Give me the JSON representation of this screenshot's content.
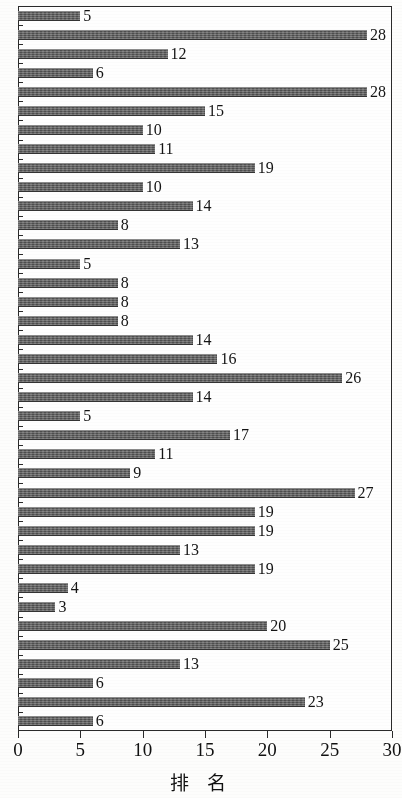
{
  "chart_data": {
    "type": "bar",
    "orientation": "horizontal",
    "title": "",
    "xlabel": "排  名",
    "ylabel": "",
    "xlim": [
      0,
      30
    ],
    "ylim": [
      0,
      38
    ],
    "grid": false,
    "legend": null,
    "xticks": [
      0,
      5,
      10,
      15,
      20,
      25,
      30
    ],
    "xtick_labels": [
      "0",
      "5",
      "10",
      "15",
      "20",
      "25",
      "30"
    ],
    "ytick_labels": [],
    "bar_color": "#5d5d5d",
    "frame_color": "#2a2a2a",
    "background_color": "#fefefe",
    "show_value_labels": true,
    "categories": [
      "1",
      "2",
      "3",
      "4",
      "5",
      "6",
      "7",
      "8",
      "9",
      "10",
      "11",
      "12",
      "13",
      "14",
      "15",
      "16",
      "17",
      "18",
      "19",
      "20",
      "21",
      "22",
      "23",
      "24",
      "25",
      "26",
      "27",
      "28",
      "29",
      "30",
      "31",
      "32",
      "33",
      "34",
      "35",
      "36",
      "37",
      "38"
    ],
    "values": [
      5,
      28,
      12,
      6,
      28,
      15,
      10,
      11,
      19,
      10,
      14,
      8,
      13,
      5,
      8,
      8,
      8,
      14,
      16,
      26,
      14,
      5,
      17,
      11,
      9,
      27,
      19,
      19,
      13,
      19,
      4,
      3,
      20,
      25,
      13,
      6,
      23,
      6
    ],
    "value_labels": [
      "5",
      "28",
      "12",
      "6",
      "28",
      "15",
      "10",
      "11",
      "19",
      "10",
      "14",
      "8",
      "13",
      "5",
      "8",
      "8",
      "8",
      "14",
      "16",
      "26",
      "14",
      "5",
      "17",
      "11",
      "9",
      "27",
      "19",
      "19",
      "13",
      "19",
      "4",
      "3",
      "20",
      "25",
      "13",
      "6",
      "23",
      "6"
    ]
  }
}
